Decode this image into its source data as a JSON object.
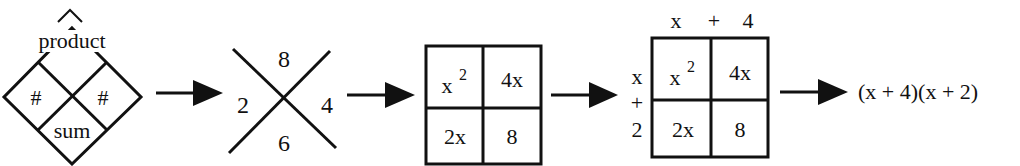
{
  "diagram": {
    "step1_diamond": {
      "top_label": "product",
      "left_label": "#",
      "right_label": "#",
      "bottom_label": "sum"
    },
    "step2_x": {
      "top": "8",
      "left": "2",
      "right": "4",
      "bottom": "6"
    },
    "step3_box": {
      "cells": {
        "top_left_base": "x",
        "top_left_exp": "2",
        "top_right": "4x",
        "bottom_left": "2x",
        "bottom_right": "8"
      }
    },
    "step4_box": {
      "top_header": {
        "a": "x",
        "op": "+",
        "b": "4"
      },
      "side_header": {
        "a": "x",
        "op": "+",
        "b": "2"
      },
      "cells": {
        "top_left_base": "x",
        "top_left_exp": "2",
        "top_right": "4x",
        "bottom_left": "2x",
        "bottom_right": "8"
      }
    },
    "result": "(x + 4)(x + 2)",
    "colors": {
      "ink": "#111111",
      "background": "#ffffff"
    }
  }
}
